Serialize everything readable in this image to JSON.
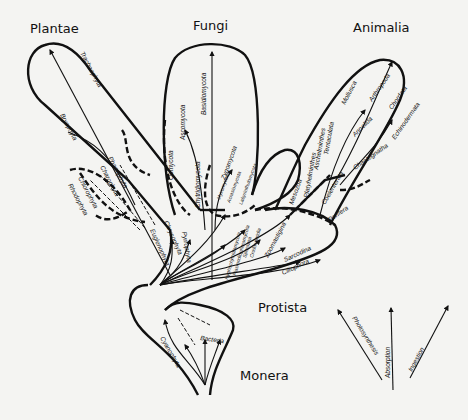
{
  "kingdoms": {
    "plantae": "Plantae",
    "fungi": "Fungi",
    "animalia": "Animalia",
    "protista": "Protista",
    "monera": "Monera"
  },
  "plantae_taxa": [
    "Tracheophyta",
    "Bryophyta",
    "Phaeophyta",
    "Charophyta",
    "Chlorophyta",
    "Rhodophyta"
  ],
  "fungi_taxa": [
    "Basidiomycota",
    "Ascomycota",
    "Oomycota",
    "Chytridiomycota",
    "Zygomycota",
    "Myxomycota",
    "Acrasiomycota",
    "Labyrinthulomycota"
  ],
  "animalia_taxa": [
    "Mollusca",
    "Arthropoda",
    "Chordata",
    "Echinodermata",
    "Annelida",
    "Chaetognatha",
    "Tentaculata",
    "Aschelminthes",
    "Platyhelminthes",
    "Coelenterata",
    "Porifera",
    "Mesozoa"
  ],
  "protista_taxa": [
    "Euglenophyta",
    "Chrysophyta",
    "Pyrrophyta",
    "Hyphochytridiomycota",
    "Plasmodiophoromycota",
    "Sporozoa",
    "Cnidosporidia",
    "Zoomastigina",
    "Sarcodina",
    "Ciliophora"
  ],
  "monera_taxa": [
    "Cyanophyta",
    "Bacteria"
  ],
  "nutrition_legend": [
    "Photosynthesis",
    "Absorption",
    "Ingestion"
  ]
}
